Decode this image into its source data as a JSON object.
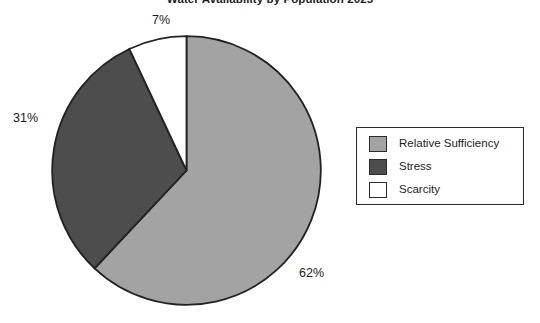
{
  "chart_data": {
    "type": "pie",
    "title": "Water Availability by Population 2025",
    "xlabel": "",
    "ylabel": "",
    "grid": false,
    "legend_position": "right",
    "start_angle_deg": 90,
    "direction": "clockwise",
    "categories": [
      "Relative Sufficiency",
      "Stress",
      "Scarcity"
    ],
    "values": [
      62,
      31,
      7
    ],
    "value_labels": [
      "62%",
      "31%",
      "7%"
    ],
    "colors": [
      "#a3a3a3",
      "#4d4d4d",
      "#ffffff"
    ],
    "slice_border_color": "#222222",
    "slices": [
      {
        "label": "Relative Sufficiency",
        "value": 62,
        "display": "62%",
        "color": "#a3a3a3"
      },
      {
        "label": "Stress",
        "value": 31,
        "display": "31%",
        "color": "#4d4d4d"
      },
      {
        "label": "Scarcity",
        "value": 7,
        "display": "7%",
        "color": "#ffffff"
      }
    ]
  },
  "title": {
    "text": "Water Availability by Population 2025"
  },
  "labels": {
    "top": "7%",
    "left": "31%",
    "bottom": "62%"
  },
  "legend": {
    "items": [
      {
        "label": "Relative Sufficiency",
        "color": "#a3a3a3"
      },
      {
        "label": "Stress",
        "color": "#4d4d4d"
      },
      {
        "label": "Scarcity",
        "color": "#ffffff"
      }
    ]
  }
}
